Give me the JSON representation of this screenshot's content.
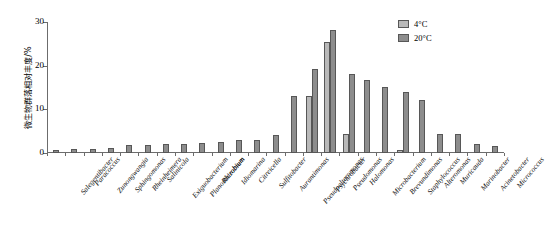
{
  "chart_data": {
    "type": "bar",
    "title": "",
    "xlabel": "",
    "ylabel": "微生物群落相对丰度/%",
    "ylim": [
      0,
      30
    ],
    "yticks": [
      0,
      10,
      20,
      30
    ],
    "grid": false,
    "legend_position": "top-right",
    "categories": [
      "Salegentibacter",
      "Paracoccus",
      "Zunongwangia",
      "Sphingomonas",
      "Rheinheimera",
      "Salinicola",
      "Exiguobacterium",
      "Planomicrobium",
      "Rhizobium",
      "Idiomarina",
      "Citreicella",
      "Sulfitobacter",
      "Aurantimonas",
      "Pseudoalteromonas",
      "Psychrobacter",
      "Pseudomonas",
      "Halomonas",
      "Microbacterium",
      "Brevundimonas",
      "Staphylococcus",
      "Alteromonas",
      "Muricauda",
      "Marinobacter",
      "Acinetobacter",
      "Micrococcus"
    ],
    "series": [
      {
        "name": "4°C",
        "color": "#b9b9b9",
        "values": [
          0,
          0,
          0,
          0,
          0,
          0,
          0,
          0,
          0,
          0,
          0,
          0,
          0,
          0,
          13.0,
          25.4,
          4.4,
          0,
          0,
          0.7,
          0,
          0,
          0,
          0,
          0
        ]
      },
      {
        "name": "20°C",
        "color": "#8d8d8d",
        "values": [
          0.6,
          1.0,
          1.0,
          1.2,
          1.8,
          1.8,
          2.0,
          2.1,
          2.3,
          2.5,
          2.9,
          3.0,
          4.2,
          13.1,
          19.2,
          28.1,
          18.1,
          16.8,
          15.2,
          14.0,
          12.2,
          4.3,
          4.4,
          2.0,
          1.7
        ]
      }
    ]
  },
  "legend": {
    "items": [
      {
        "label": "4°C",
        "color": "#b9b9b9"
      },
      {
        "label": "20°C",
        "color": "#8d8d8d"
      }
    ]
  }
}
